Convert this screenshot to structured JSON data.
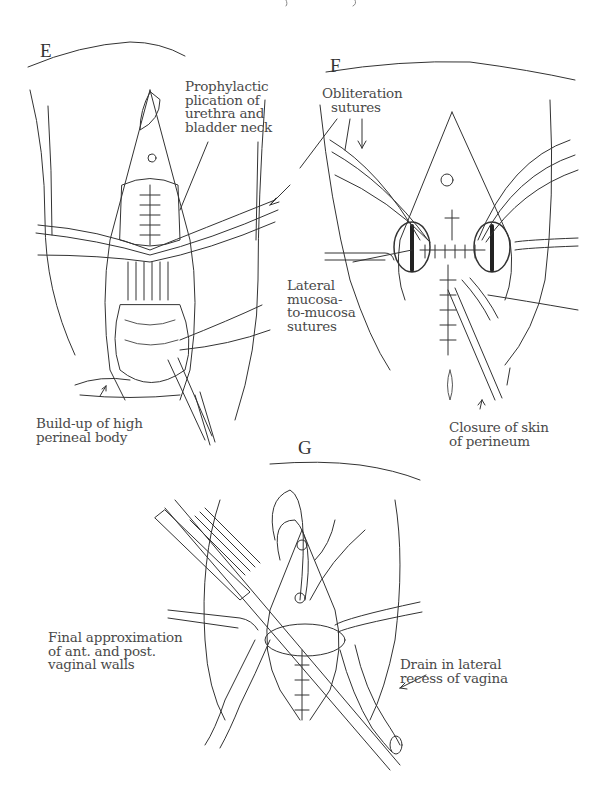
{
  "figure": {
    "panels": [
      {
        "id": "E",
        "letter": "E",
        "labels": [
          {
            "name": "prophylactic-plication-label",
            "lines": [
              "Prophylactic",
              "plication of",
              "urethra and",
              "bladder neck"
            ]
          },
          {
            "name": "perineal-body-label",
            "lines": [
              "Build-up of high",
              "perineal body"
            ]
          }
        ]
      },
      {
        "id": "F",
        "letter": "F",
        "labels": [
          {
            "name": "obliteration-sutures-label",
            "lines": [
              "Obliteration",
              "sutures"
            ]
          },
          {
            "name": "lateral-mucosa-label",
            "lines": [
              "Lateral",
              "mucosa-",
              "to-mucosa",
              "sutures"
            ]
          },
          {
            "name": "closure-skin-label",
            "lines": [
              "Closure of skin",
              "of perineum"
            ]
          }
        ]
      },
      {
        "id": "G",
        "letter": "G",
        "labels": [
          {
            "name": "final-approximation-label",
            "lines": [
              "Final approximation",
              "of ant. and post.",
              "vaginal walls"
            ]
          },
          {
            "name": "drain-label",
            "lines": [
              "Drain in lateral",
              "recess of vagina"
            ]
          }
        ]
      }
    ]
  }
}
